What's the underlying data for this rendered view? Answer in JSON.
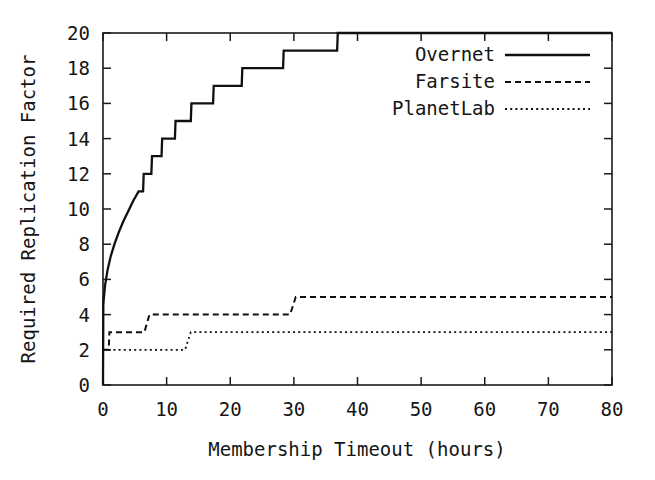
{
  "chart_data": {
    "type": "line",
    "title": "",
    "xlabel": "Membership Timeout (hours)",
    "ylabel": "Required Replication Factor",
    "xlim": [
      0,
      80
    ],
    "ylim": [
      0,
      20
    ],
    "xticks": [
      0,
      10,
      20,
      30,
      40,
      50,
      60,
      70,
      80
    ],
    "yticks": [
      0,
      2,
      4,
      6,
      8,
      10,
      12,
      14,
      16,
      18,
      20
    ],
    "xtick_labels": [
      "0",
      "10",
      "20",
      "30",
      "40",
      "50",
      "60",
      "70",
      "80"
    ],
    "ytick_labels": [
      "0",
      "2",
      "4",
      "6",
      "8",
      "10",
      "12",
      "14",
      "16",
      "18",
      "20"
    ],
    "grid": false,
    "legend_position": "top-right",
    "series": [
      {
        "name": "Overnet",
        "style": "solid",
        "points": [
          [
            0.0,
            0.0
          ],
          [
            0.05,
            4.6
          ],
          [
            0.3,
            5.6
          ],
          [
            0.7,
            6.5
          ],
          [
            1.2,
            7.3
          ],
          [
            1.8,
            8.0
          ],
          [
            2.5,
            8.7
          ],
          [
            3.2,
            9.3
          ],
          [
            4.0,
            9.9
          ],
          [
            4.8,
            10.5
          ],
          [
            5.6,
            11.0
          ],
          [
            5.7,
            11.0
          ],
          [
            6.3,
            11.0
          ],
          [
            6.4,
            12.0
          ],
          [
            7.6,
            12.0
          ],
          [
            7.7,
            13.0
          ],
          [
            9.2,
            13.0
          ],
          [
            9.3,
            14.0
          ],
          [
            11.3,
            14.0
          ],
          [
            11.4,
            15.0
          ],
          [
            13.8,
            15.0
          ],
          [
            13.9,
            16.0
          ],
          [
            17.3,
            16.0
          ],
          [
            17.4,
            17.0
          ],
          [
            21.8,
            17.0
          ],
          [
            21.9,
            18.0
          ],
          [
            28.3,
            18.0
          ],
          [
            28.4,
            19.0
          ],
          [
            36.8,
            19.0
          ],
          [
            36.9,
            20.0
          ],
          [
            48.5,
            20.0
          ],
          [
            48.6,
            20.0
          ],
          [
            80.0,
            20.0
          ]
        ]
      },
      {
        "name": "Farsite",
        "style": "dashed",
        "points": [
          [
            0.0,
            2.0
          ],
          [
            0.9,
            2.0
          ],
          [
            1.0,
            3.0
          ],
          [
            6.4,
            3.0
          ],
          [
            6.5,
            3.0
          ],
          [
            7.3,
            4.0
          ],
          [
            29.3,
            4.0
          ],
          [
            29.4,
            4.0
          ],
          [
            30.3,
            5.0
          ],
          [
            80.0,
            5.0
          ]
        ]
      },
      {
        "name": "PlanetLab",
        "style": "dotted",
        "points": [
          [
            0.0,
            2.0
          ],
          [
            12.8,
            2.0
          ],
          [
            12.9,
            2.0
          ],
          [
            13.8,
            3.0
          ],
          [
            80.0,
            3.0
          ]
        ]
      }
    ]
  },
  "legend": {
    "entries": [
      {
        "label": "Overnet",
        "style": "solid"
      },
      {
        "label": "Farsite",
        "style": "dashed"
      },
      {
        "label": "PlanetLab",
        "style": "dotted"
      }
    ]
  },
  "colors": {
    "ink": "#1a1a1a",
    "background": "#ffffff"
  }
}
